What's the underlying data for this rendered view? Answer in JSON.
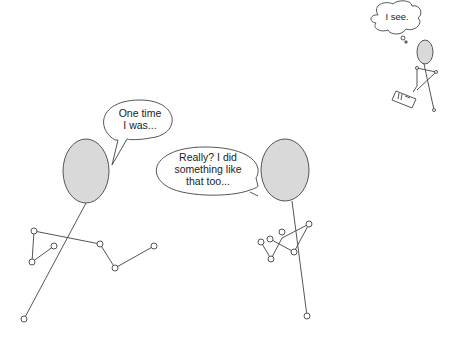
{
  "scene": {
    "description": "Stick figure conversation with an eavesdropper taking notes",
    "colors": {
      "head_fill": "#d9d9d9",
      "stroke": "#555555",
      "background": "#ffffff"
    }
  },
  "bubbles": {
    "left_speech": {
      "line1": "One time",
      "line2": "I was..."
    },
    "right_speech": {
      "line1": "Really? I did",
      "line2": "something like",
      "line3": "that too..."
    },
    "thought": {
      "text": "I see."
    }
  },
  "figures": [
    {
      "name": "left-speaker"
    },
    {
      "name": "right-speaker"
    },
    {
      "name": "eavesdropper",
      "holding": "notepad"
    }
  ]
}
